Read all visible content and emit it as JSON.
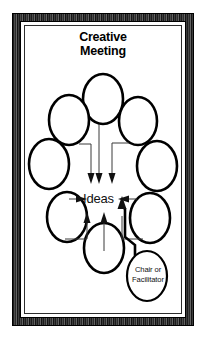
{
  "diagram": {
    "title": "Creative\nMeeting",
    "center_label": "Ideas",
    "facilitator_label": "Chair or\nFacilitator",
    "colors": {
      "line": "#000000",
      "connector": "#3a3a3a",
      "background": "#ffffff",
      "frame": "#2b2b2b"
    },
    "participants": [
      {
        "name": "participant-top",
        "cx": 78,
        "cy": 73,
        "rx": 20,
        "ry": 25
      },
      {
        "name": "participant-top-left",
        "cx": 44,
        "cy": 94,
        "rx": 20,
        "ry": 25
      },
      {
        "name": "participant-top-right",
        "cx": 113,
        "cy": 95,
        "rx": 19,
        "ry": 24
      },
      {
        "name": "participant-left",
        "cx": 24,
        "cy": 138,
        "rx": 20,
        "ry": 25
      },
      {
        "name": "participant-right",
        "cx": 132,
        "cy": 140,
        "rx": 20,
        "ry": 25
      },
      {
        "name": "participant-bottom-left",
        "cx": 42,
        "cy": 191,
        "rx": 20,
        "ry": 25
      },
      {
        "name": "participant-bottom-right",
        "cx": 125,
        "cy": 192,
        "rx": 20,
        "ry": 25
      },
      {
        "name": "participant-bottom",
        "cx": 79,
        "cy": 222,
        "rx": 20,
        "ry": 25
      }
    ],
    "facilitator_oval": {
      "cx": 122,
      "cy": 250,
      "rx": 20,
      "ry": 25
    },
    "arrows": [
      {
        "name": "arrow-from-top-left",
        "direction": "down"
      },
      {
        "name": "arrow-from-top",
        "direction": "down"
      },
      {
        "name": "arrow-from-top-right",
        "direction": "down"
      },
      {
        "name": "arrow-from-left",
        "direction": "right"
      },
      {
        "name": "arrow-from-right",
        "direction": "left"
      },
      {
        "name": "arrow-from-bottom-left",
        "direction": "up"
      },
      {
        "name": "arrow-from-bottom",
        "direction": "up"
      },
      {
        "name": "arrow-from-facilitator",
        "direction": "up"
      }
    ]
  }
}
